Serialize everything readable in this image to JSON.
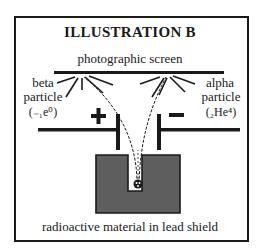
{
  "title": "ILLUSTRATION B",
  "labels": {
    "screen": "photographic screen",
    "beta_line1": "beta",
    "beta_line2": "particle",
    "beta_notation": "(₋₁e⁰)",
    "alpha_line1": "alpha",
    "alpha_line2": "particle",
    "alpha_notation": "(₂He⁴)",
    "plus": "+",
    "minus": "−",
    "source": "radioactive material in lead shield"
  },
  "colors": {
    "ink": "#1a1a1a",
    "lead_shield": "#5e5e5e",
    "background": "#ffffff"
  }
}
